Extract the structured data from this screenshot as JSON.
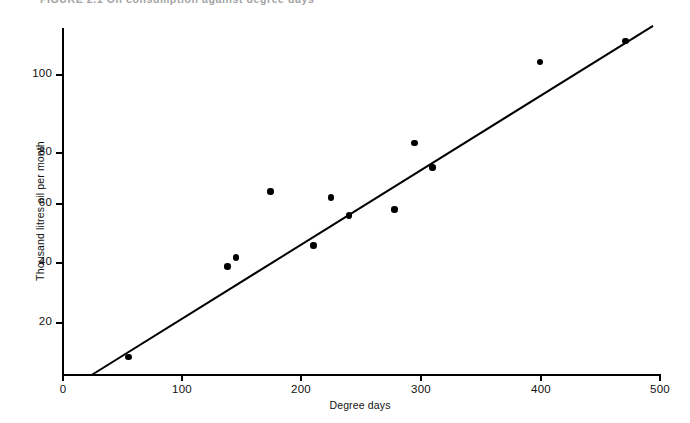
{
  "caption": {
    "text": "FIGURE 2.1  Oil consumption against degree days"
  },
  "chart_data": {
    "type": "scatter",
    "title": "",
    "xlabel": "Degree days",
    "ylabel": "Thousand litres oil per month",
    "xlim": [
      0,
      500
    ],
    "ylim": [
      0,
      115
    ],
    "xticks": [
      0,
      100,
      200,
      300,
      400,
      500
    ],
    "yticks": [
      20,
      40,
      60,
      80,
      100
    ],
    "xticklabels": [
      "0",
      "100",
      "200",
      "300",
      "400",
      "500"
    ],
    "yticklabels": [
      "20",
      "40",
      "60",
      "80",
      "100"
    ],
    "grid": false,
    "legend": null,
    "marker": "filled-circle",
    "points": [
      {
        "x": 55,
        "y": 6
      },
      {
        "x": 138,
        "y": 36
      },
      {
        "x": 145,
        "y": 39
      },
      {
        "x": 174,
        "y": 61
      },
      {
        "x": 210,
        "y": 43
      },
      {
        "x": 225,
        "y": 59
      },
      {
        "x": 240,
        "y": 53
      },
      {
        "x": 278,
        "y": 55
      },
      {
        "x": 295,
        "y": 77
      },
      {
        "x": 310,
        "y": 69
      },
      {
        "x": 400,
        "y": 104
      },
      {
        "x": 472,
        "y": 111
      }
    ],
    "fit_line": {
      "type": "linear-regression",
      "x_start": 24,
      "y_start": 0,
      "x_end": 495,
      "y_end": 116
    },
    "colors": {
      "axis": "#000000",
      "marker": "#000000",
      "line": "#000000",
      "background": "#ffffff"
    }
  }
}
